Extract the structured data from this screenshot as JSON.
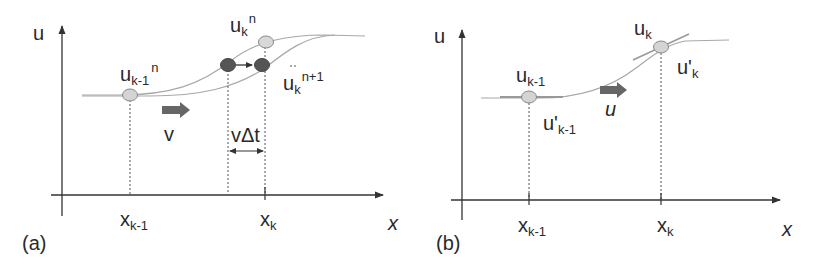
{
  "panels": [
    {
      "id": "a",
      "panel_label": "(a)",
      "axis_y_label": "u",
      "axis_x_label": "x",
      "tick_labels": [
        {
          "base": "x",
          "sub": "k-1"
        },
        {
          "base": "x",
          "sub": "k"
        }
      ],
      "point_labels": {
        "u_km1_n": {
          "base": "u",
          "sub": "k-1",
          "sup": "n"
        },
        "u_k_n": {
          "base": "u",
          "sub": "k",
          "sup": "n"
        },
        "u_k_np1": {
          "base": "u",
          "sub": "k",
          "sup": "n+1"
        }
      },
      "velocity_label": "v",
      "displacement_label": "vΔt"
    },
    {
      "id": "b",
      "panel_label": "(b)",
      "axis_y_label": "u",
      "axis_x_label": "x",
      "tick_labels": [
        {
          "base": "x",
          "sub": "k-1"
        },
        {
          "base": "x",
          "sub": "k"
        }
      ],
      "point_labels": {
        "u_km1": {
          "base": "u",
          "sub": "k-1"
        },
        "u_k": {
          "base": "u",
          "sub": "k"
        },
        "du_km1": {
          "base": "u'",
          "sub": "k-1"
        },
        "du_k": {
          "base": "u'",
          "sub": "k"
        }
      },
      "velocity_label": "u"
    }
  ],
  "colors": {
    "axis": "#333333",
    "curve": "#a8a8a8",
    "light_point": "#d4d4d4",
    "dark_point": "#555555",
    "arrow": "#5a5a5a",
    "text": "#2a2a2a"
  }
}
